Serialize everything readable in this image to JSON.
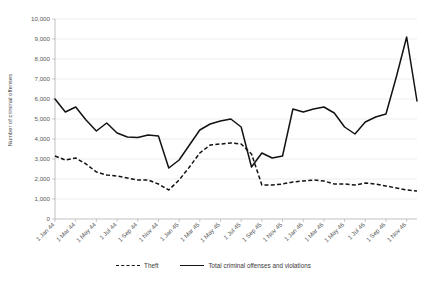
{
  "chart_data": {
    "type": "line",
    "title": "",
    "xlabel": "",
    "ylabel": "Number of criminal offenses",
    "ylim": [
      0,
      10000
    ],
    "ytick_labels": [
      "0",
      "1,000",
      "2,000",
      "3,000",
      "4,000",
      "5,000",
      "6,000",
      "7,000",
      "8,000",
      "9,000",
      "10,000"
    ],
    "ytick_values": [
      0,
      1000,
      2000,
      3000,
      4000,
      5000,
      6000,
      7000,
      8000,
      9000,
      10000
    ],
    "grid": true,
    "legend_position": "bottom",
    "x": [
      "1 Jan 44",
      "1 Feb 44",
      "1 Mar 44",
      "1 Apr 44",
      "1 May 44",
      "1 Jun 44",
      "1 Jul 44",
      "1 Aug 44",
      "1 Sep 44",
      "1 Oct 44",
      "1 Nov 44",
      "1 Dec 44",
      "1 Jan 45",
      "1 Feb 45",
      "1 Mar 45",
      "1 Apr 45",
      "1 May 45",
      "1 Jun 45",
      "1 Jul 45",
      "1 Aug 45",
      "1 Sep 45",
      "1 Oct 45",
      "1 Nov 45",
      "1 Dec 45",
      "1 Jan 46",
      "1 Feb 46",
      "1 Mar 46",
      "1 Apr 46",
      "1 May 46",
      "1 Jun 46",
      "1 Jul 46",
      "1 Aug 46",
      "1 Sep 46",
      "1 Oct 46",
      "1 Nov 46",
      "1 Dec 46"
    ],
    "xtick_labels": [
      "1 Jan 44",
      "1 Mar 44",
      "1 May 44",
      "1 Jul 44",
      "1 Sep 44",
      "1 Nov 44",
      "1 Jan 45",
      "1 Mar 45",
      "1 May 45",
      "1 Jul 45",
      "1 Sep 45",
      "1 Nov 45",
      "1 Jan 46",
      "1 Mar 46",
      "1 May 46",
      "1 Jul 46",
      "1 Sep 46",
      "1 Nov 46"
    ],
    "series": [
      {
        "name": "Total criminal offenses and violations",
        "style": "solid",
        "values": [
          6000,
          5350,
          5600,
          4950,
          4400,
          4800,
          4300,
          4100,
          4070,
          4200,
          4150,
          2550,
          2950,
          3700,
          4450,
          4750,
          4900,
          5000,
          4600,
          2600,
          3300,
          3050,
          3150,
          5500,
          5350,
          5500,
          5600,
          5300,
          4600,
          4250,
          4850,
          5100,
          5250,
          7100,
          9100,
          5900
        ]
      },
      {
        "name": "Theft",
        "style": "dashed",
        "values": [
          3150,
          2950,
          3050,
          2750,
          2350,
          2200,
          2150,
          2050,
          1950,
          1950,
          1750,
          1450,
          1950,
          2600,
          3300,
          3700,
          3750,
          3800,
          3750,
          3250,
          1700,
          1700,
          1750,
          1850,
          1900,
          1950,
          1900,
          1750,
          1750,
          1700,
          1800,
          1750,
          1650,
          1550,
          1450,
          1400
        ]
      }
    ]
  },
  "legend": {
    "entries": [
      {
        "label": "Theft",
        "style": "dashed"
      },
      {
        "label": "Total criminal offenses and violations",
        "style": "solid"
      }
    ]
  }
}
